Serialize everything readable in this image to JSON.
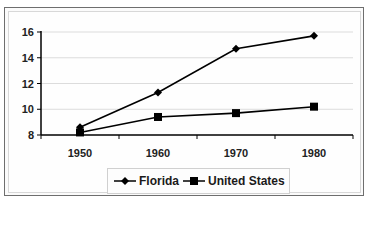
{
  "chart_data": {
    "type": "line",
    "title": "",
    "xlabel": "",
    "ylabel": "",
    "categories": [
      "1950",
      "1960",
      "1970",
      "1980"
    ],
    "series": [
      {
        "name": "Florida",
        "marker": "diamond",
        "color": "#000000",
        "values": [
          8.6,
          11.3,
          14.7,
          15.7
        ]
      },
      {
        "name": "United States",
        "marker": "square",
        "color": "#000000",
        "values": [
          8.2,
          9.4,
          9.7,
          10.2
        ]
      }
    ],
    "ylim": [
      8,
      16
    ],
    "yticks": [
      "8",
      "10",
      "12",
      "14",
      "16"
    ],
    "grid": "horizontal major gridlines",
    "legend_position": "bottom"
  },
  "legend": {
    "items": [
      {
        "label": "Florida",
        "marker": "diamond-icon"
      },
      {
        "label": "United States",
        "marker": "square-icon"
      }
    ]
  }
}
